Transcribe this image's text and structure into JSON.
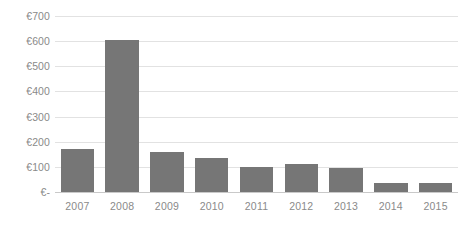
{
  "chart_data": {
    "type": "bar",
    "title": "",
    "xlabel": "",
    "ylabel": "",
    "categories": [
      "2007",
      "2008",
      "2009",
      "2010",
      "2011",
      "2012",
      "2013",
      "2014",
      "2015"
    ],
    "values": [
      170,
      605,
      160,
      136,
      100,
      112,
      96,
      36,
      36
    ],
    "ylim": [
      0,
      700
    ],
    "y_ticks": [
      0,
      100,
      200,
      300,
      400,
      500,
      600,
      700
    ],
    "y_tick_labels": [
      "€-",
      "€100",
      "€200",
      "€300",
      "€400",
      "€500",
      "€600",
      "€700"
    ],
    "currency_symbol": "€",
    "grid": true,
    "legend": false,
    "legend_position": "none",
    "series": [
      {
        "name": "",
        "values": [
          170,
          605,
          160,
          136,
          100,
          112,
          96,
          36,
          36
        ],
        "color": "#767676"
      }
    ],
    "colors": {
      "bar": "#767676",
      "gridline": "#e2e2e2",
      "axis": "#c9c9c9",
      "tick_label": "#8a8a8a",
      "background": "#ffffff"
    }
  }
}
